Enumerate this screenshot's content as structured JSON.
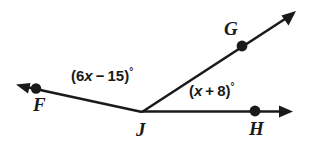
{
  "figure": {
    "type": "geometry-angle-diagram",
    "background_color": "#ffffff",
    "stroke_color": "#1a1a1a",
    "width": 313,
    "height": 151,
    "vertex": {
      "name": "J",
      "x": 142,
      "y": 112
    },
    "points": [
      {
        "id": "F",
        "label": "F",
        "x": 36,
        "y": 89,
        "label_x": 33,
        "label_y": 95
      },
      {
        "id": "G",
        "label": "G",
        "x": 242,
        "y": 46,
        "label_x": 224,
        "label_y": 19
      },
      {
        "id": "H",
        "label": "H",
        "x": 255,
        "y": 111,
        "label_x": 249,
        "label_y": 119
      },
      {
        "id": "J",
        "label": "J",
        "x": 142,
        "y": 112,
        "label_x": 136,
        "label_y": 120
      }
    ],
    "rays": [
      {
        "id": "ray-JF",
        "from": "J",
        "through": "F",
        "tip_x": 18,
        "tip_y": 85,
        "arrowhead": true
      },
      {
        "id": "ray-JG",
        "from": "J",
        "through": "G",
        "tip_x": 295,
        "tip_y": 12,
        "arrowhead": true
      },
      {
        "id": "ray-JH",
        "from": "J",
        "through": "H",
        "tip_x": 292,
        "tip_y": 111,
        "arrowhead": true
      }
    ],
    "angles": [
      {
        "id": "angle-FJG",
        "expression": "(6x − 15)°",
        "open_paren": "(",
        "coefficient": "6",
        "variable": "x",
        "operator": "−",
        "constant": "15",
        "close_paren": ")",
        "degree_symbol": "°",
        "label_x": 71,
        "label_y": 68
      },
      {
        "id": "angle-GJH",
        "expression": "(x + 8)°",
        "open_paren": "(",
        "coefficient": "",
        "variable": "x",
        "operator": "+",
        "constant": "8",
        "close_paren": ")",
        "degree_symbol": "°",
        "label_x": 189,
        "label_y": 83
      }
    ]
  }
}
